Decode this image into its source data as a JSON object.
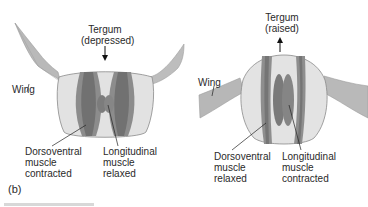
{
  "panel_label": "(b)",
  "left_diagram": {
    "tergum": {
      "line1": "Tergum",
      "line2": "(depressed)",
      "arrow": "down"
    },
    "wing_label": "Wing",
    "dorsoventral": {
      "line1": "Dorsoventral",
      "line2": "muscle",
      "line3": "contracted"
    },
    "longitudinal": {
      "line1": "Longitudinal",
      "line2": "muscle",
      "line3": "relaxed"
    }
  },
  "right_diagram": {
    "tergum": {
      "line1": "Tergum",
      "line2": "(raised)",
      "arrow": "up"
    },
    "wing_label": "Wing",
    "dorsoventral": {
      "line1": "Dorsoventral",
      "line2": "muscle",
      "line3": "relaxed"
    },
    "longitudinal": {
      "line1": "Longitudinal",
      "line2": "muscle",
      "line3": "contracted"
    }
  },
  "colors": {
    "body_fill": "#e3e3e3",
    "body_outline": "#8a8a8a",
    "wing_fill": "#b5b5b5",
    "muscle_dark": "#7d7d7d",
    "muscle_mid": "#9a9a9a",
    "text": "#2a2a2a"
  }
}
